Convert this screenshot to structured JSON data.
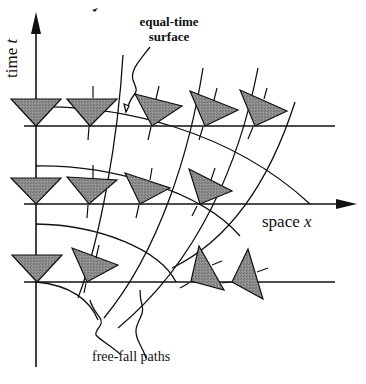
{
  "diagram": {
    "labels": {
      "time_axis": "time",
      "time_var": "t",
      "space_axis": "space",
      "space_var": "x",
      "equal_time_line1": "equal-time",
      "equal_time_line2": "surface",
      "free_fall": "free-fall paths"
    },
    "colors": {
      "line": "#111111",
      "triangle_fill": "#8a8a8a",
      "background": "#ffffff"
    },
    "rows": [
      {
        "name": "row-top",
        "y": 126,
        "triangles": 5
      },
      {
        "name": "row-middle",
        "y": 204,
        "triangles": 4
      },
      {
        "name": "row-bottom",
        "y": 282,
        "triangles": 4
      }
    ]
  }
}
